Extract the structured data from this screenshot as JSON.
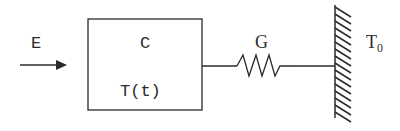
{
  "diagram": {
    "type": "lumped thermal system",
    "input": {
      "label": "E",
      "description": "heat input arrow"
    },
    "capacitor_block": {
      "capacitance_label": "C",
      "temperature_label": "T(t)"
    },
    "conductance": {
      "label": "G",
      "symbol": "zigzag resistor"
    },
    "reservoir": {
      "label": "T",
      "subscript": "0",
      "symbol": "hatched wall"
    },
    "colors": {
      "stroke": "#2a2a2a",
      "background": "#ffffff"
    }
  }
}
